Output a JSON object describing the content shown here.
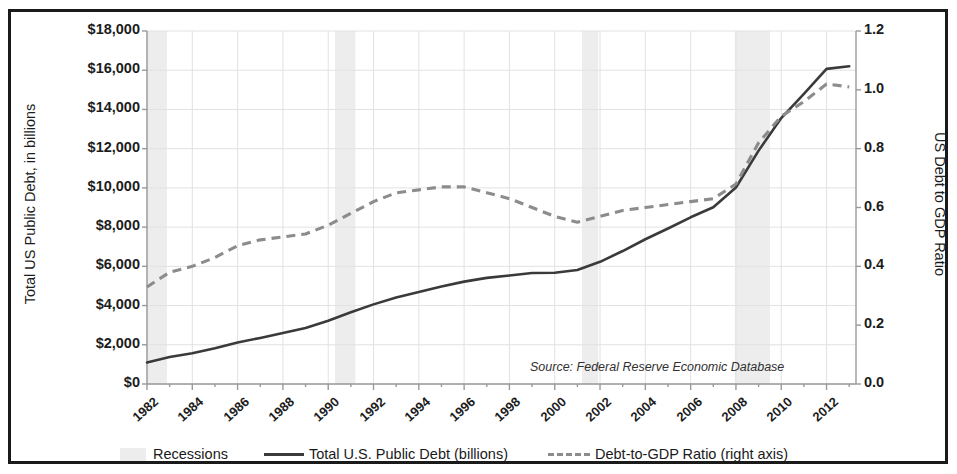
{
  "chart_data": {
    "type": "line",
    "title": "",
    "xlabel": "",
    "ylabel": "Total US Public Debt, in billions",
    "ylabel_right": "US Debt to GDP Ratio",
    "grid": true,
    "legend_position": "bottom",
    "xlim": [
      1982,
      2013.3
    ],
    "ylim": [
      0,
      18000
    ],
    "ylim_right": [
      0.0,
      1.2
    ],
    "x_tick_labels": [
      "1982",
      "1984",
      "1986",
      "1988",
      "1990",
      "1992",
      "1994",
      "1996",
      "1998",
      "2000",
      "2002",
      "2004",
      "2006",
      "2008",
      "2010",
      "2012"
    ],
    "y_tick_labels_left": [
      "$18,000",
      "$16,000",
      "$14,000",
      "$12,000",
      "$10,000",
      "$8,000",
      "$6,000",
      "$4,000",
      "$2,000",
      "$0"
    ],
    "y_tick_values_left": [
      18000,
      16000,
      14000,
      12000,
      10000,
      8000,
      6000,
      4000,
      2000,
      0
    ],
    "y_tick_labels_right": [
      "1.2",
      "1.0",
      "0.8",
      "0.6",
      "0.4",
      "0.2",
      "0.0"
    ],
    "y_tick_values_right": [
      1.2,
      1.0,
      0.8,
      0.6,
      0.4,
      0.2,
      0.0
    ],
    "annotation": "Source: Federal Reserve Economic Database",
    "x": [
      1982,
      1983,
      1984,
      1985,
      1986,
      1987,
      1988,
      1989,
      1990,
      1991,
      1992,
      1993,
      1994,
      1995,
      1996,
      1997,
      1998,
      1999,
      2000,
      2001,
      2002,
      2003,
      2004,
      2005,
      2006,
      2007,
      2008,
      2009,
      2010,
      2011,
      2012,
      2013
    ],
    "series": [
      {
        "name": "Total U.S. Public Debt (billions)",
        "axis": "left",
        "style": "solid",
        "color": "#3a3a3a",
        "values": [
          1100,
          1380,
          1570,
          1820,
          2120,
          2350,
          2600,
          2860,
          3230,
          3660,
          4060,
          4410,
          4690,
          4970,
          5220,
          5410,
          5530,
          5660,
          5670,
          5810,
          6230,
          6780,
          7380,
          7930,
          8500,
          9010,
          10020,
          11900,
          13560,
          14790,
          16070,
          16200
        ]
      },
      {
        "name": "Debt-to-GDP Ratio (right axis)",
        "axis": "right",
        "style": "dashed",
        "color": "#8c8c8c",
        "values": [
          0.33,
          0.38,
          0.4,
          0.43,
          0.47,
          0.49,
          0.5,
          0.51,
          0.54,
          0.58,
          0.62,
          0.65,
          0.66,
          0.67,
          0.67,
          0.65,
          0.63,
          0.6,
          0.57,
          0.55,
          0.57,
          0.59,
          0.6,
          0.61,
          0.62,
          0.63,
          0.68,
          0.82,
          0.91,
          0.96,
          1.02,
          1.01
        ]
      }
    ],
    "recession_bands": [
      {
        "label": "1981-82 recession",
        "start": 1982.0,
        "end": 1982.88
      },
      {
        "label": "1990-91 recession",
        "start": 1990.3,
        "end": 1991.2
      },
      {
        "label": "2001 recession",
        "start": 2001.2,
        "end": 2001.92
      },
      {
        "label": "2007-09 recession",
        "start": 2007.95,
        "end": 2009.5
      }
    ],
    "recession_color": "#ededed"
  },
  "legend": {
    "items": [
      {
        "label": "Recessions",
        "marker": "band"
      },
      {
        "label": "Total U.S. Public Debt (billions)",
        "marker": "solid-line"
      },
      {
        "label": "Debt-to-GDP Ratio (right axis)",
        "marker": "dashed-line"
      }
    ]
  },
  "colors": {
    "frame": "#1a1a1a",
    "grid": "#e2e2e2",
    "axis": "#9a9a9a",
    "debt_line": "#3a3a3a",
    "ratio_line": "#8c8c8c",
    "recession": "#ededed"
  }
}
